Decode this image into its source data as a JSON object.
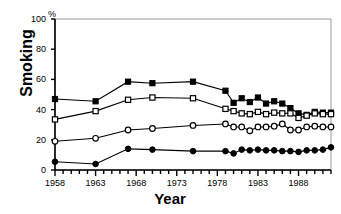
{
  "chart_data": {
    "type": "line",
    "title": "",
    "xlabel": "Year",
    "ylabel": "Smoking",
    "unit_label": "%",
    "xlim": [
      1958,
      1992
    ],
    "ylim": [
      0,
      100
    ],
    "grid": false,
    "legend": "none",
    "y_ticks": [
      0,
      20,
      40,
      60,
      80,
      100
    ],
    "y_tick_labels": [
      "0",
      "20",
      "40",
      "60",
      "80",
      "100"
    ],
    "x_ticks": [
      1958,
      1959,
      1960,
      1961,
      1962,
      1963,
      1964,
      1965,
      1966,
      1967,
      1968,
      1969,
      1970,
      1971,
      1972,
      1973,
      1974,
      1975,
      1976,
      1977,
      1978,
      1979,
      1980,
      1981,
      1982,
      1983,
      1984,
      1985,
      1986,
      1987,
      1988,
      1989,
      1990,
      1991,
      1992
    ],
    "x_tick_labels": [
      "1958",
      "1963",
      "1968",
      "1973",
      "1978",
      "1983",
      "1988"
    ],
    "x_labelled_ticks": [
      1958,
      1963,
      1968,
      1973,
      1978,
      1983,
      1988
    ],
    "series": [
      {
        "name": "filled-square-series",
        "marker": "filled-square",
        "color": "#000000",
        "x": [
          1958,
          1963,
          1967,
          1970,
          1975,
          1979,
          1980,
          1981,
          1982,
          1983,
          1984,
          1985,
          1986,
          1987,
          1988,
          1989,
          1990,
          1991,
          1992
        ],
        "values": [
          47,
          45.5,
          58.5,
          57.5,
          58.5,
          52.5,
          44.5,
          47.5,
          45,
          48,
          44,
          45.5,
          44,
          41,
          37.5,
          36.5,
          38.5,
          38,
          38
        ]
      },
      {
        "name": "open-square-series",
        "marker": "open-square",
        "color": "#000000",
        "x": [
          1958,
          1963,
          1967,
          1970,
          1975,
          1979,
          1980,
          1981,
          1982,
          1983,
          1984,
          1985,
          1986,
          1987,
          1988,
          1989,
          1990,
          1991,
          1992
        ],
        "values": [
          33.5,
          39,
          46.5,
          48,
          47.5,
          40.5,
          39,
          37.5,
          37,
          38.5,
          37,
          38,
          37.5,
          37.5,
          34.5,
          36,
          37.5,
          37,
          37
        ]
      },
      {
        "name": "open-circle-series",
        "marker": "open-circle",
        "color": "#000000",
        "x": [
          1958,
          1963,
          1967,
          1970,
          1975,
          1979,
          1980,
          1981,
          1982,
          1983,
          1984,
          1985,
          1986,
          1987,
          1988,
          1989,
          1990,
          1991,
          1992
        ],
        "values": [
          19,
          21,
          26.5,
          27.5,
          29.5,
          30.5,
          28.5,
          28.5,
          26,
          28.5,
          28.5,
          29,
          30.5,
          26.5,
          26.5,
          28.5,
          29,
          28.5,
          28.5
        ]
      },
      {
        "name": "filled-circle-series",
        "marker": "filled-circle",
        "color": "#000000",
        "x": [
          1958,
          1963,
          1967,
          1970,
          1975,
          1979,
          1980,
          1981,
          1982,
          1983,
          1984,
          1985,
          1986,
          1987,
          1988,
          1989,
          1990,
          1991,
          1992
        ],
        "values": [
          5.5,
          4,
          14,
          13.5,
          12.5,
          12.5,
          11,
          13.5,
          13,
          13.5,
          13,
          13,
          12.5,
          12.5,
          12,
          13,
          13,
          13.5,
          15
        ]
      }
    ]
  },
  "axes": {
    "y_axis_title": "Smoking",
    "x_axis_title": "Year",
    "percent_symbol": "%"
  }
}
